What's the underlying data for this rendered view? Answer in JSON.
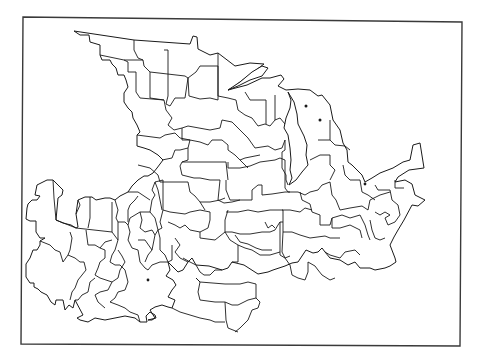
{
  "figure": {
    "type": "outline-map",
    "colors": {
      "background": "#ffffff",
      "line": "#1a1a1a",
      "frame": "#3a3a3a"
    },
    "features": [
      {
        "name": "region-boundaries",
        "style": "black outline, no fill"
      },
      {
        "name": "lake-superior-shore",
        "style": "coastline"
      },
      {
        "name": "lake-michigan",
        "style": "coastline"
      },
      {
        "name": "lake-erie-shore",
        "style": "coastline"
      }
    ],
    "labels": []
  }
}
